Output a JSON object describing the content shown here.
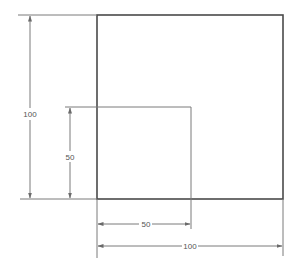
{
  "drawing": {
    "type": "dimensioned square technical drawing",
    "colors": {
      "outline": "#4a4a4a",
      "dimension_line": "#7a7a7a",
      "text": "#555555",
      "background": "#ffffff"
    },
    "shapes": {
      "outer_square": {
        "label": "outer-square",
        "size": 100
      },
      "inner_square": {
        "label": "inner-square",
        "size": 50
      }
    },
    "dimensions": {
      "vertical_outer": {
        "value": "100"
      },
      "vertical_inner": {
        "value": "50"
      },
      "horizontal_inner": {
        "value": "50"
      },
      "horizontal_outer": {
        "value": "100"
      }
    }
  }
}
